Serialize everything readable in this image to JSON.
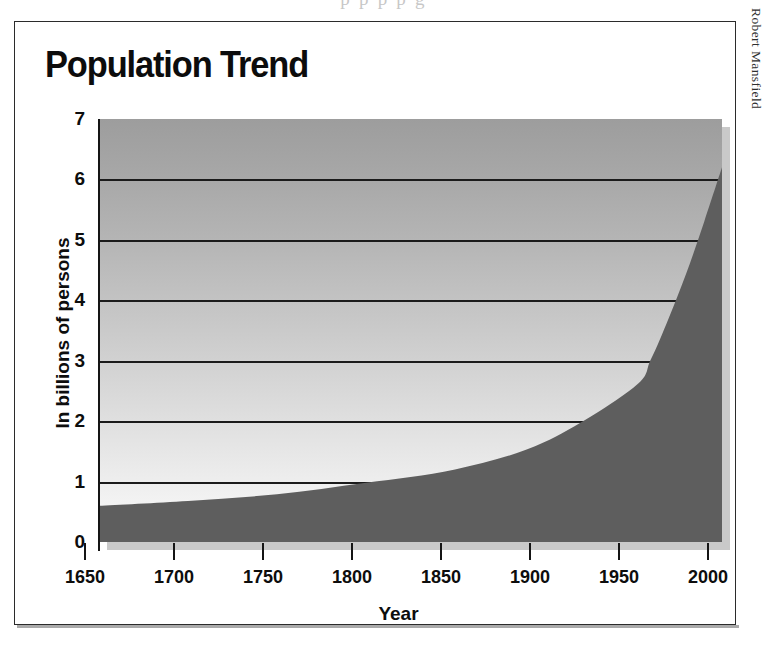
{
  "page": {
    "top_bleed_text": "p      p p     p  g",
    "credit": "Robert Mansfield"
  },
  "chart_data": {
    "type": "area",
    "title": "Population Trend",
    "xlabel": "Year",
    "ylabel": "In billions of persons",
    "xlim": [
      1650,
      2000
    ],
    "ylim": [
      0,
      7
    ],
    "xticks": [
      "1650",
      "1700",
      "1750",
      "1800",
      "1850",
      "1900",
      "1950",
      "2000"
    ],
    "yticks": [
      "0",
      "1",
      "2",
      "3",
      "4",
      "5",
      "6",
      "7"
    ],
    "grid": true,
    "legend": "none",
    "x": [
      1650,
      1700,
      1750,
      1800,
      1850,
      1900,
      1950,
      1960,
      1970,
      1980,
      1990,
      2000
    ],
    "values": [
      0.6,
      0.68,
      0.79,
      0.98,
      1.2,
      1.65,
      2.55,
      3.02,
      3.7,
      4.45,
      5.3,
      6.2
    ],
    "series": [
      {
        "name": "World population",
        "values": [
          0.6,
          0.68,
          0.79,
          0.98,
          1.2,
          1.65,
          2.55,
          3.02,
          3.7,
          4.45,
          5.3,
          6.2
        ]
      }
    ],
    "colors": {
      "area_fill": "#5e5e5e",
      "plot_background_top": "#9d9d9d",
      "plot_background_bottom": "#fafafa",
      "gridline": "#1b1b1b",
      "axis": "#151515",
      "text": "#0d0d0d"
    }
  }
}
